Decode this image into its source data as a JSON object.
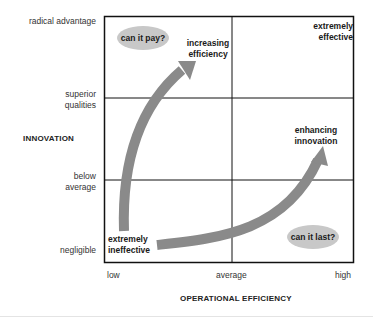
{
  "diagram": {
    "y_axis": {
      "title": "INNOVATION",
      "levels": [
        "radical advantage",
        "superior qualities",
        "below average",
        "negligible"
      ]
    },
    "x_axis": {
      "title": "OPERATIONAL EFFICIENCY",
      "levels": [
        "low",
        "average",
        "high"
      ]
    },
    "labels": {
      "extremely_effective": [
        "extremely",
        "effective"
      ],
      "increasing_efficiency": [
        "increasing",
        "efficiency"
      ],
      "enhancing_innovation": [
        "enhancing",
        "innovation"
      ],
      "extremely_ineffective": [
        "extremely",
        "ineffective"
      ]
    },
    "bubbles": {
      "can_it_pay": "can it pay?",
      "can_it_last": "can it last?"
    },
    "colors": {
      "arrow": "#8a8a8a",
      "bubble": "#c8c8c8",
      "grid": "#111111"
    }
  }
}
